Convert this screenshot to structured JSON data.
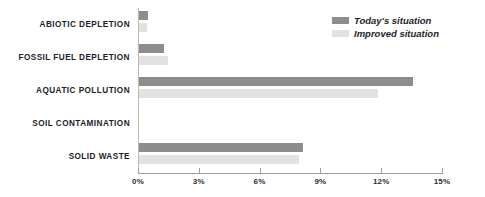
{
  "chart_data": {
    "type": "bar",
    "orientation": "horizontal",
    "title": "",
    "xlabel": "",
    "ylabel": "",
    "xlim": [
      0,
      15
    ],
    "xticks": [
      "0%",
      "3%",
      "6%",
      "9%",
      "12%",
      "15%"
    ],
    "xtick_values": [
      0,
      3,
      6,
      9,
      12,
      15
    ],
    "grid": false,
    "legend_position": "top-right",
    "categories": [
      "ABIOTIC DEPLETION",
      "FOSSIL FUEL DEPLETION",
      "AQUATIC POLLUTION",
      "SOIL CONTAMINATION",
      "SOLID WASTE"
    ],
    "series": [
      {
        "name": "Today's situation",
        "color": "#8d8d8d",
        "values": [
          0.45,
          1.25,
          13.5,
          0.0,
          8.1
        ]
      },
      {
        "name": "Improved situation",
        "color": "#e2e2e2",
        "values": [
          0.4,
          1.45,
          11.8,
          0.0,
          7.9
        ]
      }
    ]
  },
  "legend": {
    "items": [
      {
        "label": "Today's situation",
        "swatch": "legend-swatch-today"
      },
      {
        "label": "Improved situation",
        "swatch": "legend-swatch-improved"
      }
    ]
  },
  "colors": {
    "today": "#8d8d8d",
    "improved": "#e2e2e2",
    "axis": "#9e9e9e",
    "text": "#1d1d2b",
    "background": "#ffffff"
  }
}
